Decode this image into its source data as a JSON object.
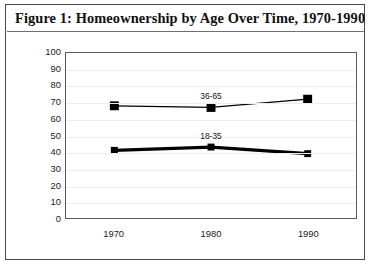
{
  "figure": {
    "title": "Figure 1: Homeownership by Age Over Time, 1970-1990"
  },
  "chart_data": {
    "type": "line",
    "title": "Figure 1: Homeownership by Age Over Time, 1970-1990",
    "xlabel": "",
    "ylabel": "",
    "categories": [
      "1970",
      "1980",
      "1990"
    ],
    "x": [
      1970,
      1980,
      1990
    ],
    "series": [
      {
        "name": "36-65",
        "values": [
          68,
          67,
          72
        ],
        "marker": "square",
        "color": "#000000",
        "label_position": "above"
      },
      {
        "name": "18-35",
        "values": [
          41,
          43,
          39
        ],
        "marker": "square",
        "color": "#000000",
        "label_position": "above"
      }
    ],
    "ylim": [
      0,
      100
    ],
    "ytick_step": 10,
    "yticks": [
      0,
      10,
      20,
      30,
      40,
      50,
      60,
      70,
      80,
      90,
      100
    ],
    "ytick_labels": [
      "0",
      "10",
      "20",
      "30",
      "40",
      "50",
      "60",
      "70",
      "80",
      "90",
      "100"
    ],
    "xtick_labels": [
      "1970",
      "1980",
      "1990"
    ],
    "grid": true,
    "grid_axis": "y",
    "legend": "inline-series-labels",
    "legend_position": "none"
  }
}
